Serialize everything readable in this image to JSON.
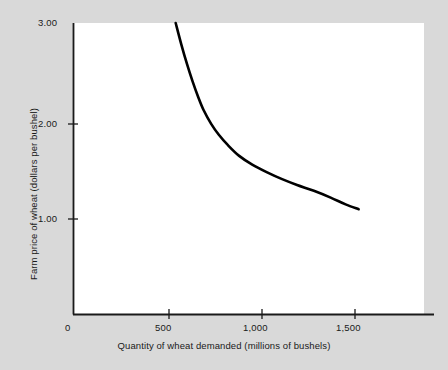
{
  "chart_data": {
    "type": "line",
    "title": "",
    "subtitle": "",
    "xlabel": "Quantity of wheat demanded (millions of bushels)",
    "ylabel": "Farm price of wheat (dollars per bushel)",
    "xlim": [
      0,
      1880
    ],
    "ylim": [
      0,
      3.0
    ],
    "xticks": [
      0,
      500,
      1000,
      1500
    ],
    "xtick_labels": [
      "0",
      "500",
      "1,000",
      "1,500"
    ],
    "yticks": [
      1.0,
      2.0,
      3.0
    ],
    "ytick_labels": [
      "1.00",
      "2.00",
      "3.00"
    ],
    "grid": false,
    "legend": null,
    "annotations": [],
    "series": [
      {
        "name": "Demand curve for wheat",
        "color": "#000000",
        "linewidth": 2.6,
        "x": [
          550,
          580,
          610,
          640,
          670,
          700,
          740,
          780,
          830,
          890,
          960,
          1040,
          1120,
          1200,
          1290,
          1380,
          1460,
          1530
        ],
        "y": [
          3.0,
          2.78,
          2.58,
          2.4,
          2.24,
          2.1,
          1.96,
          1.85,
          1.74,
          1.63,
          1.54,
          1.46,
          1.39,
          1.33,
          1.27,
          1.2,
          1.13,
          1.08
        ]
      }
    ]
  },
  "axis_color": "#1a1a1a",
  "plot_background": "#ffffff",
  "figure_background": "#d9d9d9"
}
